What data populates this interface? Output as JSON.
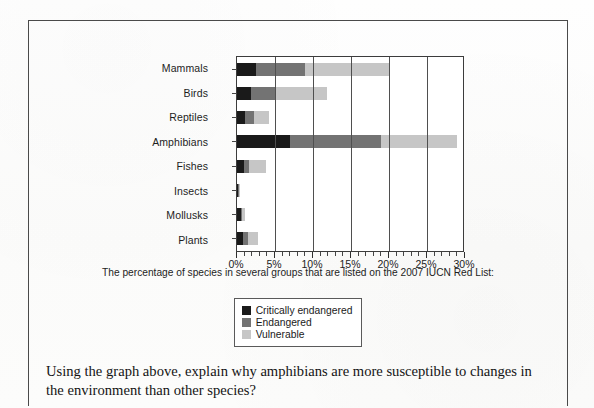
{
  "chart_data": {
    "type": "bar",
    "orientation": "horizontal",
    "stacked": true,
    "title": "",
    "caption": "The percentage of species in several groups that are listed on the 2007 IUCN Red List:",
    "xlabel": "",
    "ylabel": "",
    "xlim": [
      0,
      30
    ],
    "xtick_labels": [
      "0%",
      "5%",
      "10%",
      "15%",
      "20%",
      "25%",
      "30%"
    ],
    "xtick_values": [
      0,
      5,
      10,
      15,
      20,
      25,
      30
    ],
    "minor_tick_step": 1,
    "grid": "vertical",
    "legend_position": "below-center",
    "categories": [
      "Mammals",
      "Birds",
      "Reptiles",
      "Amphibians",
      "Fishes",
      "Insects",
      "Mollusks",
      "Plants"
    ],
    "series": [
      {
        "name": "Critically endangered",
        "color": "#1a1a1a",
        "values": [
          2.5,
          1.8,
          1.0,
          7.0,
          0.9,
          0.1,
          0.5,
          0.8
        ]
      },
      {
        "name": "Endangered",
        "color": "#737373",
        "values": [
          6.5,
          3.3,
          1.3,
          12.0,
          0.7,
          0.1,
          0.2,
          0.7
        ]
      },
      {
        "name": "Vulnerable",
        "color": "#c6c6c6",
        "values": [
          11.0,
          6.7,
          1.9,
          10.0,
          2.2,
          0.1,
          0.3,
          1.2
        ]
      }
    ],
    "totals": [
      20.0,
      11.8,
      4.2,
      29.0,
      3.8,
      0.3,
      1.0,
      2.7
    ]
  },
  "legend": {
    "items": [
      {
        "label": "Critically endangered",
        "color": "#1a1a1a"
      },
      {
        "label": "Endangered",
        "color": "#737373"
      },
      {
        "label": "Vulnerable",
        "color": "#c6c6c6"
      }
    ]
  },
  "question": {
    "text": "Using the graph above, explain why amphibians are more susceptible to changes in the environment than other species?"
  }
}
